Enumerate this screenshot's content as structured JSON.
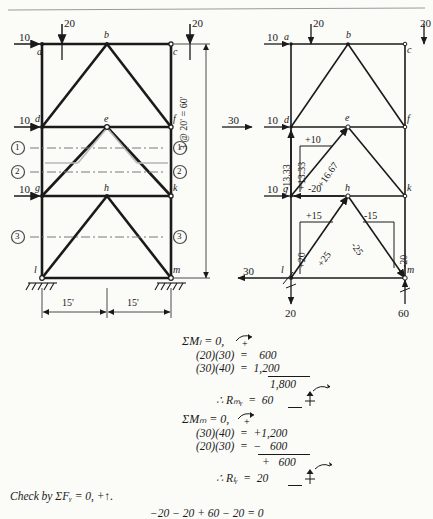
{
  "page": {
    "header_rule": true,
    "width": 433,
    "height": 510
  },
  "figures": {
    "left": {
      "name": "loaded-frame-diagram",
      "joint_labels": [
        "a",
        "b",
        "c",
        "d",
        "e",
        "f",
        "g",
        "h",
        "k",
        "l",
        "m"
      ],
      "loads": {
        "vertical": [
          "20",
          "20"
        ],
        "horizontal": [
          "10",
          "10",
          "10"
        ]
      },
      "section_cuts": [
        "1",
        "2",
        "3"
      ],
      "dimensions": {
        "vertical": "3 @ 20' = 60'",
        "horizontal_left": "15'",
        "horizontal_right": "15'"
      }
    },
    "right": {
      "name": "force-analysis-diagram",
      "joint_labels": [
        "a",
        "b",
        "c",
        "d",
        "e",
        "f",
        "g",
        "h",
        "k",
        "l",
        "m"
      ],
      "loads": {
        "vertical_top": [
          "20",
          "20"
        ],
        "horizontal": [
          "10",
          "10",
          "10"
        ],
        "resultant_top": "30",
        "reaction_horizontal": "30",
        "reaction_l_vertical": "20",
        "reaction_m_vertical": "60"
      },
      "member_forces": {
        "dg_vertical": "-13.33",
        "ge_vertical_component": "+13.33",
        "ge_horizontal_component": "+10",
        "ge_diagonal": "+16.67",
        "gh_chord": "-20",
        "lh_vertical_component": "+20",
        "lh_horizontal_component": "+15",
        "lh_diagonal": "+25",
        "hm_vertical_component": "-20",
        "hm_horizontal_component": "-15",
        "hm_diagonal": "-25"
      }
    }
  },
  "equations": {
    "lines": [
      {
        "id": "sum-moments-l",
        "text": "ΣMₗ = 0,",
        "x": 182,
        "y": 0,
        "arrow": "ccw-plus"
      },
      {
        "id": "term-l-1",
        "text": "(20)(30)  =    600",
        "x": 196,
        "y": 15
      },
      {
        "id": "term-l-2",
        "text": "(30)(40)  =  1,200",
        "x": 196,
        "y": 28
      },
      {
        "id": "sum-l-total",
        "text": "1,800",
        "x": 270,
        "y": 43
      },
      {
        "id": "result-rmy",
        "text": "∴ Rₘᵧ  =  60",
        "x": 216,
        "y": 58
      },
      {
        "id": "sum-moments-m",
        "text": "ΣMₘ = 0,",
        "x": 182,
        "y": 78,
        "arrow": "ccw-plus"
      },
      {
        "id": "term-m-1",
        "text": "(30)(40)  =  +1,200",
        "x": 196,
        "y": 93
      },
      {
        "id": "term-m-2",
        "text": "(20)(30)  =  −   600",
        "x": 196,
        "y": 106
      },
      {
        "id": "sum-m-total",
        "text": "+   600",
        "x": 262,
        "y": 121
      },
      {
        "id": "result-rly",
        "text": "∴ Rₗᵧ  =  20",
        "x": 216,
        "y": 136
      },
      {
        "id": "check-line",
        "text": "Check by ΣFᵧ = 0, +↑.",
        "x": 10,
        "y": 155
      },
      {
        "id": "check-math",
        "text": "−20 − 20 + 60 − 20 = 0",
        "x": 150,
        "y": 172
      }
    ]
  },
  "colors": {
    "ink": "#1a1a1a",
    "light_ink": "#8c8c8c",
    "paper": "#fbfbf8"
  }
}
